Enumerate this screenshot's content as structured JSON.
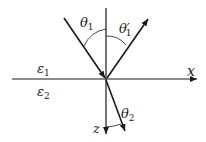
{
  "diagram": {
    "title": "",
    "type": "reflection-refraction",
    "labels": {
      "theta1": "θ",
      "theta1_sub": "1",
      "theta1p": "θ′",
      "theta1p_sub": "1",
      "theta2": "θ",
      "theta2_sub": "2",
      "eps1": "ε",
      "eps1_sub": "1",
      "eps2": "ε",
      "eps2_sub": "2",
      "x_axis": "x",
      "z_axis": "z"
    },
    "colors": {
      "line": "#1a1a1a",
      "background": "#ffffff"
    }
  }
}
